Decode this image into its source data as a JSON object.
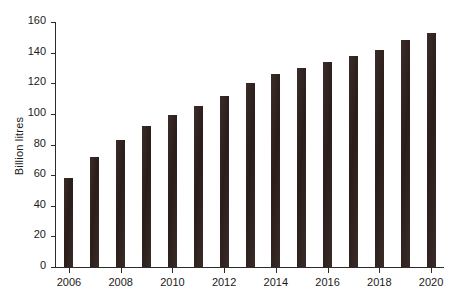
{
  "chart_data": {
    "type": "bar",
    "title": "",
    "xlabel": "",
    "ylabel": "Billion litres",
    "categories": [
      "2006",
      "2007",
      "2008",
      "2009",
      "2010",
      "2011",
      "2012",
      "2013",
      "2014",
      "2015",
      "2016",
      "2017",
      "2018",
      "2019",
      "2020"
    ],
    "values": [
      58,
      72,
      83,
      92,
      99,
      105,
      112,
      120,
      126,
      130,
      134,
      138,
      142,
      148,
      153
    ],
    "ylim": [
      0,
      160
    ],
    "yticks": [
      0,
      20,
      40,
      60,
      80,
      100,
      120,
      140,
      160
    ],
    "xtick_labels": [
      "2006",
      "2008",
      "2010",
      "2012",
      "2014",
      "2016",
      "2018",
      "2020"
    ],
    "grid": false,
    "legend": null,
    "bar_color": "#30221f",
    "axis_color": "#2b2b2b",
    "background": "#ffffff"
  }
}
